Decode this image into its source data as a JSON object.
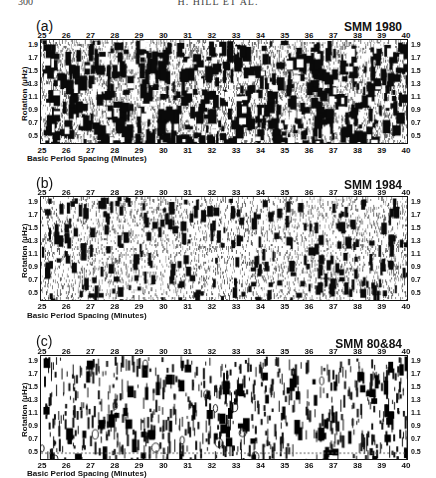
{
  "header": {
    "page_number": "300",
    "running_head": "H. HILL ET AL."
  },
  "chart_data": [
    {
      "type": "heatmap",
      "panel_label": "(a)",
      "title": "SMM 1980",
      "xlabel": "Basic Period Spacing (Minutes)",
      "ylabel": "Rotation (µHz)",
      "xlim": [
        25,
        40
      ],
      "ylim": [
        0.4,
        2.0
      ],
      "x_ticks": [
        "25",
        "26",
        "27",
        "28",
        "29",
        "30",
        "31",
        "32",
        "33",
        "34",
        "35",
        "36",
        "37",
        "38",
        "39",
        "40"
      ],
      "y_ticks": [
        "1.9",
        "1.7",
        "1.5",
        "1.3",
        "1.1",
        "0.9",
        "0.7",
        "0.5"
      ],
      "density": 0.55,
      "description": "grayscale density map, dense dark vertically elongated blobs"
    },
    {
      "type": "heatmap",
      "panel_label": "(b)",
      "title": "SMM 1984",
      "xlabel": "Basic Period Spacing (Minutes)",
      "ylabel": "Rotation (µHz)",
      "xlim": [
        25,
        40
      ],
      "ylim": [
        0.4,
        2.0
      ],
      "x_ticks": [
        "25",
        "26",
        "27",
        "28",
        "29",
        "30",
        "31",
        "32",
        "33",
        "34",
        "35",
        "36",
        "37",
        "38",
        "39",
        "40"
      ],
      "y_ticks": [
        "1.9",
        "1.7",
        "1.5",
        "1.3",
        "1.1",
        "0.9",
        "0.7",
        "0.5"
      ],
      "density": 0.35,
      "description": "grayscale density map, sparser dark streaks on light stippled background"
    },
    {
      "type": "heatmap",
      "panel_label": "(c)",
      "title": "SMM 80&84",
      "xlabel": "Basic Period Spacing (Minutes)",
      "ylabel": "Rotation (µHz)",
      "xlim": [
        25,
        40
      ],
      "ylim": [
        0.4,
        2.0
      ],
      "x_ticks": [
        "25",
        "26",
        "27",
        "28",
        "29",
        "30",
        "31",
        "32",
        "33",
        "34",
        "35",
        "36",
        "37",
        "38",
        "39",
        "40"
      ],
      "y_ticks": [
        "1.9",
        "1.7",
        "1.5",
        "1.3",
        "1.1",
        "0.9",
        "0.7",
        "0.5"
      ],
      "density": 0.25,
      "description": "contour-style map, isolated black vertical marks on white background"
    }
  ],
  "panels": [
    {
      "label": "(a)",
      "title": "SMM 1980",
      "xlabel": "Basic Period Spacing (Minutes)",
      "ylabel": "Rotation (µHz)"
    },
    {
      "label": "(b)",
      "title": "SMM 1984",
      "xlabel": "Basic Period Spacing (Minutes)",
      "ylabel": "Rotation (µHz)"
    },
    {
      "label": "(c)",
      "title": "SMM 80&84",
      "xlabel": "Basic Period Spacing (Minutes)",
      "ylabel": "Rotation (µHz)"
    }
  ]
}
